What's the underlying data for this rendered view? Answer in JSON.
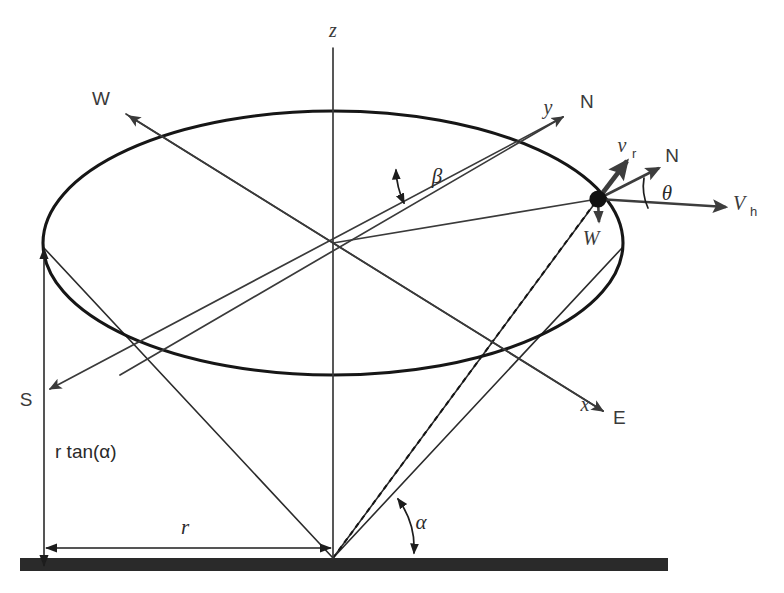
{
  "figure": {
    "type": "geometry-diagram",
    "background_color": "#ffffff",
    "line_color": "#2b2b2b",
    "ground_color": "#2a2a2a"
  },
  "axes": {
    "z": {
      "label": "z",
      "x": 333,
      "y": 37
    },
    "y": {
      "label": "y",
      "x": 548,
      "y": 114
    },
    "x": {
      "label": "x",
      "x": 585,
      "y": 411
    }
  },
  "compass": {
    "north_axis": {
      "label": "N",
      "x": 580,
      "y": 108
    },
    "north_vector": {
      "label": "N",
      "x": 679,
      "y": 162
    },
    "south": {
      "label": "S",
      "x": 26,
      "y": 406
    },
    "east": {
      "label": "E",
      "x": 620,
      "y": 424
    },
    "west_axis": {
      "label": "W",
      "x": 101,
      "y": 105
    },
    "west_vector": {
      "label": "W",
      "x": 591,
      "y": 240
    }
  },
  "vectors": {
    "radial": {
      "label": "v",
      "sub": "r",
      "x": 625,
      "y": 152
    },
    "horizontal": {
      "label": "V",
      "sub": "h",
      "x": 742,
      "y": 210
    }
  },
  "angles": {
    "alpha": {
      "label": "α",
      "x": 421,
      "y": 528
    },
    "beta": {
      "label": "β",
      "x": 437,
      "y": 182
    },
    "theta": {
      "label": "θ",
      "x": 667,
      "y": 198
    }
  },
  "dimensions": {
    "height": {
      "label": "r tan(α)",
      "x": 55,
      "y": 457
    },
    "radius": {
      "label": "r",
      "x": 185,
      "y": 533
    }
  },
  "geometry": {
    "ellipse_center": {
      "cx": 333,
      "cy": 243
    },
    "ellipse_radii": {
      "rx": 290,
      "ry": 132
    },
    "apex": {
      "x": 333,
      "y": 558
    },
    "point_on_ellipse": {
      "x": 598,
      "y": 199
    },
    "ground": {
      "x": 20,
      "y": 558,
      "width": 648,
      "height": 13
    }
  }
}
